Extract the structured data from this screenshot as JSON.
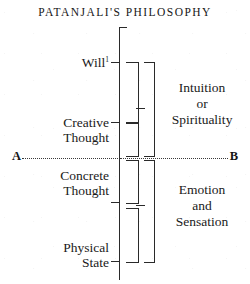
{
  "title": "PATANJALI'S PHILOSOPHY",
  "colors": {
    "background": "#ffffff",
    "ink": "#1a1a1a",
    "rule": "#2a2a2a"
  },
  "diagram": {
    "type": "vertical-scale-diagram",
    "axis_label_top": "",
    "stages": [
      {
        "id": "will",
        "label": "Will",
        "label_line2": "",
        "footnote_marker": "1"
      },
      {
        "id": "creative-thought",
        "label": "Creative",
        "label_line2": "Thought",
        "footnote_marker": ""
      },
      {
        "id": "concrete-thought",
        "label": "Concrete",
        "label_line2": "Thought",
        "footnote_marker": ""
      },
      {
        "id": "physical-state",
        "label": "Physical",
        "label_line2": "State",
        "footnote_marker": ""
      }
    ],
    "groups": [
      {
        "id": "upper-group",
        "line1": "Intuition",
        "line2": "or",
        "line3": "Spirituality"
      },
      {
        "id": "lower-group",
        "line1": "Emotion",
        "line2": "and",
        "line3": "Sensation"
      }
    ],
    "divider": {
      "id": "ab-line",
      "left_label": "A",
      "right_label": "B",
      "style": "dotted"
    }
  }
}
